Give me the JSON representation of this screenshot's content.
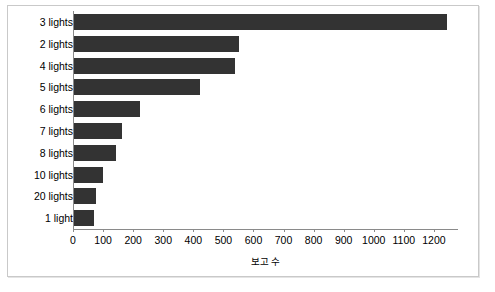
{
  "chart_data": {
    "type": "bar",
    "orientation": "horizontal",
    "title": "",
    "subtitle": "",
    "xlabel": "보고 수",
    "ylabel": "",
    "categories": [
      "3 lights",
      "2 lights",
      "4 lights",
      "5 lights",
      "6 lights",
      "7 lights",
      "8 lights",
      "10 lights",
      "20 lights",
      "1 light"
    ],
    "values": [
      1240,
      547,
      534,
      420,
      220,
      158,
      139,
      97,
      74,
      65
    ],
    "xlim": [
      0,
      1280
    ],
    "ylim": null,
    "xticks": [
      0,
      100,
      200,
      300,
      400,
      500,
      600,
      700,
      800,
      900,
      1000,
      1100,
      1200
    ],
    "xticklabels": [
      "0",
      "100",
      "200",
      "300",
      "400",
      "500",
      "600",
      "700",
      "800",
      "900",
      "1000",
      "1100",
      "1200"
    ],
    "grid": false,
    "legend": null,
    "legend_position": "none",
    "bar_color": "#333333",
    "axis_color": "#8a8a8a",
    "background_color": "#ffffff",
    "frame_border_color": "#c9c9c9",
    "annotations": []
  }
}
